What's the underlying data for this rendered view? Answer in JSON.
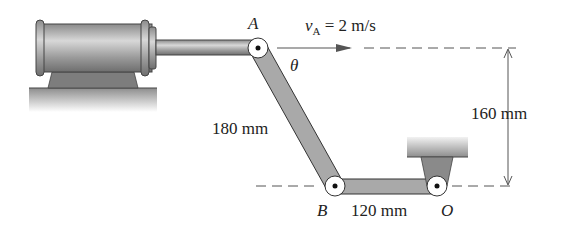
{
  "diagram": {
    "points": {
      "A": "A",
      "B": "B",
      "O": "O"
    },
    "velocity": {
      "symbol": "v",
      "subscript": "A",
      "value": " = 2 m/s"
    },
    "angle_label": "θ",
    "dimensions": {
      "link_AB": "180 mm",
      "link_BO": "120 mm",
      "vertical": "160 mm"
    },
    "colors": {
      "link": "#a9a9a9",
      "outline": "#333333",
      "dash": "#555555"
    }
  }
}
